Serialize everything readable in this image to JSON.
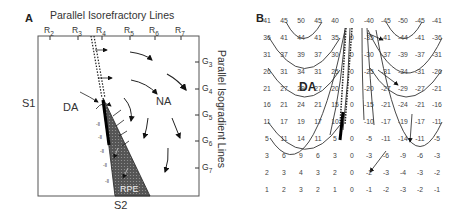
{
  "panel_a": {
    "letter": "A",
    "top_title": "Parallel Isorefractory Lines",
    "right_title": "Parallel Isogradient Lines",
    "r_ticks": [
      {
        "base": "R",
        "sub": "2"
      },
      {
        "base": "R",
        "sub": "3"
      },
      {
        "base": "R",
        "sub": "4"
      },
      {
        "base": "R",
        "sub": "5"
      },
      {
        "base": "R",
        "sub": "6"
      },
      {
        "base": "R",
        "sub": "7"
      }
    ],
    "g_ticks": [
      {
        "base": "G",
        "sub": "3"
      },
      {
        "base": "G",
        "sub": "4"
      },
      {
        "base": "G",
        "sub": "5"
      },
      {
        "base": "G",
        "sub": "6"
      },
      {
        "base": "G",
        "sub": "7"
      }
    ],
    "left_label": "S1",
    "bottom_label": "S2",
    "region_da": "DA",
    "region_na": "NA",
    "region_rpe": "RPE"
  },
  "panel_b": {
    "letter": "B",
    "region_da": "DA",
    "grid": [
      [
        "41",
        "45",
        "50",
        "45",
        "40",
        "0",
        "-40",
        "-45",
        "-50",
        "-45",
        "-41"
      ],
      [
        "36",
        "41",
        "44",
        "41",
        "35",
        "0",
        "-35",
        "-41",
        "-44",
        "-41",
        "-36"
      ],
      [
        "31",
        "37",
        "39",
        "37",
        "30",
        "0",
        "-30",
        "-37",
        "-39",
        "-37",
        "-31"
      ],
      [
        "26",
        "31",
        "34",
        "31",
        "25",
        "0",
        "-25",
        "-31",
        "-34",
        "-31",
        "-26"
      ],
      [
        "21",
        "27",
        "29",
        "27",
        "20",
        "0",
        "-20",
        "-27",
        "-29",
        "-27",
        "-21"
      ],
      [
        "16",
        "21",
        "24",
        "21",
        "15",
        "0",
        "-15",
        "-21",
        "-24",
        "-21",
        "-16"
      ],
      [
        "11",
        "17",
        "19",
        "17",
        "10",
        "0",
        "-10",
        "-17",
        "-19",
        "-17",
        "-11"
      ],
      [
        "5",
        "11",
        "14",
        "11",
        "5",
        "0",
        "-5",
        "-11",
        "-14",
        "-11",
        "-5"
      ],
      [
        "3",
        "6",
        "9",
        "6",
        "3",
        "0",
        "-3",
        "-6",
        "-9",
        "-6",
        "-3"
      ],
      [
        "2",
        "3",
        "4",
        "3",
        "2",
        "0",
        "-2",
        "-3",
        "-4",
        "-3",
        "-2"
      ],
      [
        "1",
        "2",
        "3",
        "2",
        "1",
        "0",
        "-1",
        "-2",
        "-3",
        "-2",
        "-1"
      ]
    ]
  }
}
